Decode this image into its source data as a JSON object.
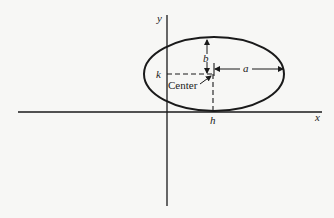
{
  "diagram": {
    "type": "ellipse-in-coordinate-plane",
    "axes": {
      "x_label": "x",
      "y_label": "y"
    },
    "ellipse": {
      "center_label": "Center",
      "center_x_label": "h",
      "center_y_label": "k",
      "semi_major_label": "a",
      "semi_minor_label": "b"
    },
    "colors": {
      "background": "#f7f7f5",
      "stroke": "#1a1a1a"
    }
  }
}
